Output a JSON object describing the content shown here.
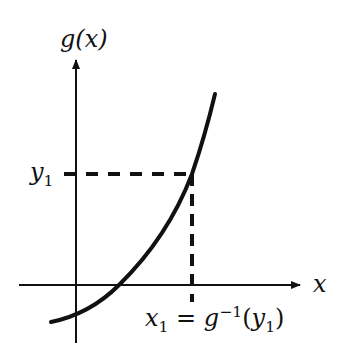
{
  "diagram": {
    "colors": {
      "stroke": "#111111",
      "background": "#ffffff"
    },
    "labels": {
      "y_axis": "g(x)",
      "x_axis": "x",
      "y1": {
        "base": "y",
        "sub": "1"
      },
      "x1_expr": {
        "x": "x",
        "x_sub": "1",
        "eq": "=",
        "g": "g",
        "sup": "−1",
        "open": "(",
        "y": "y",
        "y_sub": "1",
        "close": ")"
      }
    },
    "geometry": {
      "y_axis": {
        "x": 76,
        "y_top": 58,
        "y_bottom": 343
      },
      "x_axis": {
        "y": 285,
        "x_left": 19,
        "x_right": 302
      },
      "point": {
        "x": 192,
        "y": 174
      },
      "curve_path": "M 51 322 Q 90 314 119 285 Q 168 237 192 174 Q 205 136 215 94"
    }
  }
}
